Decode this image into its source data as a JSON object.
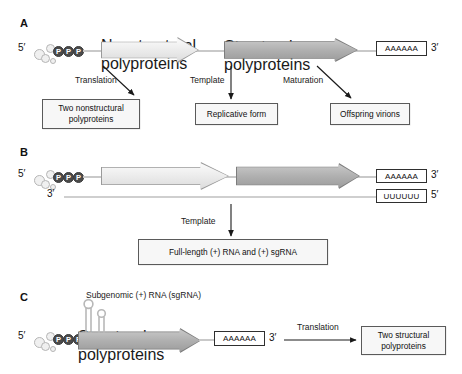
{
  "figure": {
    "panels": [
      "A",
      "B",
      "C"
    ]
  },
  "panelA": {
    "letter": "A",
    "five_prime": "5′",
    "three_prime": "3′",
    "cap_phosphates": [
      "P",
      "P",
      "P"
    ],
    "orf1_label": "Nonstructural polyproteins",
    "orf2_label": "Structural polyproteins",
    "polyA_label": "AAAAAA",
    "process_labels": [
      "Translation",
      "Template",
      "Maturation"
    ],
    "outcomes": [
      "Two nonstructural polyproteins",
      "Replicative form",
      "Offspring virions"
    ]
  },
  "panelB": {
    "letter": "B",
    "plus_five_prime": "5′",
    "plus_three_prime": "3′",
    "minus_three_prime": "3′",
    "minus_five_prime": "5′",
    "cap_phosphates": [
      "P",
      "P",
      "P"
    ],
    "orf1_label": "",
    "orf2_label": "",
    "polyA_label": "AAAAAA",
    "polyU_label": "UUUUUU",
    "process_label": "Template",
    "outcome": "Full-length (+) RNA and (+) sgRNA"
  },
  "panelC": {
    "letter": "C",
    "header": "Subgenomic (+) RNA (sgRNA)",
    "five_prime": "5′",
    "three_prime": "3′",
    "cap_phosphates": [
      "P",
      "P",
      "P"
    ],
    "orf_label": "Structural polyproteins",
    "polyA_label": "AAAAAA",
    "process_label": "Translation",
    "outcome": "Two structural polyproteins"
  },
  "colors": {
    "background": "#ffffff",
    "text": "#1a1a1a",
    "orf_light_fill": "#ededed",
    "orf_light_stroke": "#9a9a9a",
    "orf_dark_fill": "#b0b0b0",
    "orf_dark_stroke": "#7d7d7d",
    "rna_line": "#c9c9c9",
    "phosphate_fill": "#4a4a4a",
    "box_stroke": "#5a5a5a",
    "box_fill": "#f7f7f7",
    "arrow_stroke": "#1a1a1a"
  }
}
